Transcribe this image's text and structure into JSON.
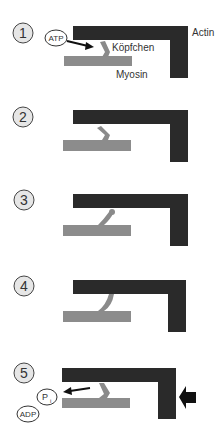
{
  "colors": {
    "actin": "#2a2a2a",
    "myosin": "#8c8c8c",
    "head": "#8a8a8a",
    "step_circle_fill": "#e6e6e6",
    "text": "#333333"
  },
  "labels": {
    "actin": "Actin",
    "myosin": "Myosin",
    "head": "Köpfchen",
    "atp": "ATP",
    "pi": "P",
    "pi_sub": "i",
    "adp": "ADP"
  },
  "steps": [
    {
      "number": "1"
    },
    {
      "number": "2"
    },
    {
      "number": "3"
    },
    {
      "number": "4"
    },
    {
      "number": "5"
    }
  ]
}
